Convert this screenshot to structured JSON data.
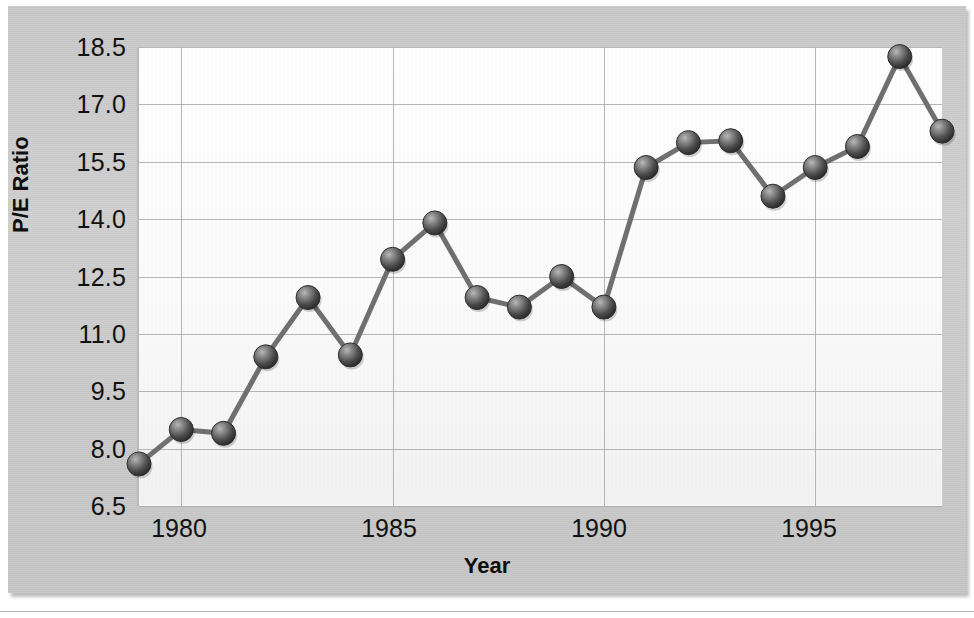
{
  "chart_data": {
    "type": "line",
    "title": "",
    "xlabel": "Year",
    "ylabel": "P/E Ratio",
    "xlim": [
      1979,
      1998
    ],
    "ylim": [
      6.5,
      18.5
    ],
    "grid": true,
    "legend": "none",
    "ytick_labels": [
      "18.5",
      "17.0",
      "15.5",
      "14.0",
      "12.5",
      "11.0",
      "9.5",
      "8.0",
      "6.5"
    ],
    "ytick_values": [
      18.5,
      17.0,
      15.5,
      14.0,
      12.5,
      11.0,
      9.5,
      8.0,
      6.5
    ],
    "xtick_labels": [
      "1980",
      "1985",
      "1990",
      "1995"
    ],
    "xtick_values": [
      1980,
      1985,
      1990,
      1995
    ],
    "x": [
      1979,
      1980,
      1981,
      1982,
      1983,
      1984,
      1985,
      1986,
      1987,
      1988,
      1989,
      1990,
      1991,
      1992,
      1993,
      1994,
      1995,
      1996,
      1997,
      1998
    ],
    "values": [
      7.6,
      8.5,
      8.4,
      10.4,
      11.95,
      10.45,
      12.95,
      13.9,
      11.95,
      11.7,
      12.5,
      11.7,
      15.35,
      16.0,
      16.05,
      14.6,
      15.35,
      15.9,
      18.25,
      16.3
    ],
    "series": [
      {
        "name": "P/E Ratio",
        "values": [
          7.6,
          8.5,
          8.4,
          10.4,
          11.95,
          10.45,
          12.95,
          13.9,
          11.95,
          11.7,
          12.5,
          11.7,
          15.35,
          16.0,
          16.05,
          14.6,
          15.35,
          15.9,
          18.25,
          16.3
        ]
      }
    ],
    "marker": "sphere",
    "marker_color": "#555555",
    "line_color": "#6f6f6f"
  },
  "style": {
    "plate_background": "#cacaca",
    "plot_background": "#fbfbfb",
    "grid_color": "#a9a9a9",
    "text_color": "#111111"
  }
}
